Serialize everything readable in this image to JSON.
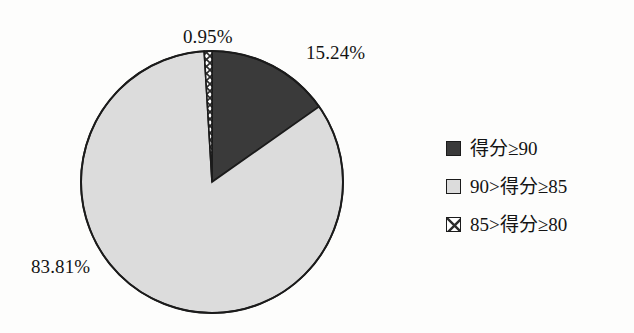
{
  "chart_data": {
    "type": "pie",
    "title": "",
    "subtitle": "",
    "xlabel": "",
    "ylabel": "",
    "legend_position": "right",
    "grid": false,
    "start_angle_deg": 0,
    "direction": "clockwise",
    "center": {
      "x": 212,
      "y": 182
    },
    "radius": 131,
    "categories": [
      "得分≥90",
      "90>得分≥85",
      "85>得分≥80"
    ],
    "values": [
      15.24,
      83.81,
      0.95
    ],
    "value_labels": [
      "15.24%",
      "83.81%",
      "0.95%"
    ],
    "slices": [
      {
        "label": "得分≥90",
        "value": 15.24,
        "value_label": "15.24%",
        "fill": "#3a3a3a",
        "pattern": "solid",
        "start_deg": 0,
        "end_deg": 54.864
      },
      {
        "label": "90>得分≥85",
        "value": 83.81,
        "value_label": "83.81%",
        "fill": "#dcdcdc",
        "pattern": "solid",
        "start_deg": 54.864,
        "end_deg": 356.58
      },
      {
        "label": "85>得分≥80",
        "value": 0.95,
        "value_label": "0.95%",
        "fill": "#ffffff",
        "pattern": "crosshatch",
        "start_deg": 356.58,
        "end_deg": 360
      }
    ]
  },
  "chart": {
    "labels": {
      "small_slice": "0.95%",
      "dark_slice": "15.24%",
      "light_slice": "83.81%"
    },
    "outline_color": "#1b1b1b"
  },
  "legend": {
    "items": [
      {
        "label": "得分≥90",
        "swatch": "solid-dark",
        "color": "#3a3a3a"
      },
      {
        "label": "90>得分≥85",
        "swatch": "solid-light",
        "color": "#dcdcdc"
      },
      {
        "label": "85>得分≥80",
        "swatch": "crosshatch",
        "color": "#ffffff"
      }
    ]
  }
}
